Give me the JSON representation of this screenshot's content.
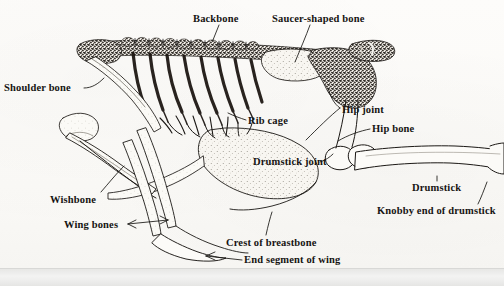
{
  "figure": {
    "background_color": "#fcfbf8",
    "ink_color": "#161412",
    "page_edge_color": "#ececeb"
  },
  "labels": [
    {
      "id": "backbone",
      "text": "Backbone",
      "x": 193,
      "y": 13
    },
    {
      "id": "saucer",
      "text": "Saucer-shaped bone",
      "x": 272,
      "y": 13
    },
    {
      "id": "shoulder",
      "text": "Shoulder bone",
      "x": 4,
      "y": 82
    },
    {
      "id": "ribcage",
      "text": "Rib cage",
      "x": 248,
      "y": 115
    },
    {
      "id": "hipjoint",
      "text": "Hip joint",
      "x": 342,
      "y": 104
    },
    {
      "id": "hipbone",
      "text": "Hip bone",
      "x": 372,
      "y": 123
    },
    {
      "id": "drumstickjoint",
      "text": "Drumstick joint",
      "x": 253,
      "y": 156
    },
    {
      "id": "drumstick",
      "text": "Drumstick",
      "x": 412,
      "y": 182
    },
    {
      "id": "knobbyend",
      "text": "Knobby end of drumstick",
      "x": 377,
      "y": 205
    },
    {
      "id": "wishbone",
      "text": "Wishbone",
      "x": 50,
      "y": 194
    },
    {
      "id": "wingbones",
      "text": "Wing bones",
      "x": 64,
      "y": 219
    },
    {
      "id": "crest",
      "text": "Crest of breastbone",
      "x": 226,
      "y": 237
    },
    {
      "id": "endsegment",
      "text": "End segment of wing",
      "x": 244,
      "y": 254
    }
  ],
  "anatomy_parts": [
    "backbone",
    "saucer-shaped bone",
    "shoulder bone",
    "rib cage",
    "hip joint",
    "hip bone",
    "drumstick joint",
    "drumstick",
    "knobby end of drumstick",
    "wishbone",
    "wing bones",
    "crest of breastbone",
    "end segment of wing"
  ]
}
